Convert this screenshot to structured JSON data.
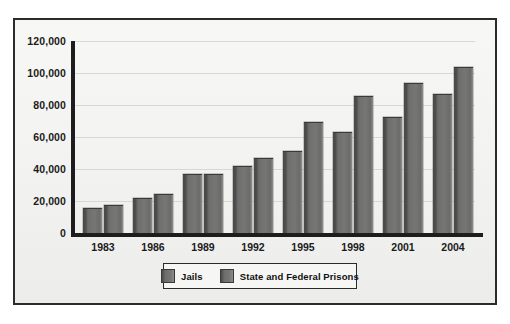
{
  "chart_data": {
    "type": "bar",
    "title": "",
    "subtitle": "",
    "xlabel": "",
    "ylabel": "",
    "categories": [
      "1983",
      "1986",
      "1989",
      "1992",
      "1995",
      "1998",
      "2001",
      "2004"
    ],
    "series": [
      {
        "name": "Jails",
        "color": "#70706e",
        "values": [
          15000,
          21500,
          36000,
          41000,
          50500,
          62500,
          72000,
          86000
        ]
      },
      {
        "name": "State and Federal Prisons",
        "color": "#70706e",
        "values": [
          17000,
          24000,
          36500,
          46500,
          68500,
          85000,
          93000,
          103000
        ]
      }
    ],
    "ylim": [
      0,
      120000
    ],
    "yticks": [
      0,
      20000,
      40000,
      60000,
      80000,
      100000,
      120000
    ],
    "ytick_labels": [
      "0",
      "20,000",
      "40,000",
      "60,000",
      "80,000",
      "100,000",
      "120,000"
    ],
    "grid": true,
    "legend_position": "bottom-center"
  },
  "legend": {
    "items": [
      {
        "label": "Jails"
      },
      {
        "label": "State and Federal Prisons"
      }
    ]
  },
  "style": {
    "frame_color": "#2b2b2b",
    "axis_color": "#1d1d1d",
    "background": "#f4f4f2",
    "bar_color": "#70706e",
    "text_color": "#1b1b1b"
  }
}
